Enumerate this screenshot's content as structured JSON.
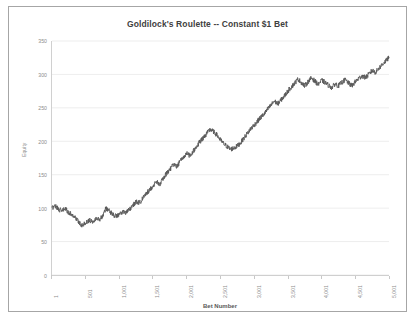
{
  "chart_data": {
    "type": "line",
    "title": "Goldilock's Roulette -- Constant $1 Bet",
    "xlabel": "Bet Number",
    "ylabel": "Equity",
    "grid": "horizontal",
    "legend": "none",
    "line_color": "#595959",
    "gridline_color": "#e8e8e8",
    "axis_color": "#bfbfbf",
    "tick_label_color": "#8c8c8c",
    "title_color": "#404040",
    "xlim": [
      1,
      5001
    ],
    "ylim": [
      0,
      350
    ],
    "yticks": [
      0,
      50,
      100,
      150,
      200,
      250,
      300,
      350
    ],
    "ytick_labels": [
      "0",
      "50",
      "100",
      "150",
      "200",
      "250",
      "300",
      "350"
    ],
    "xticks": [
      1,
      501,
      1001,
      1501,
      2001,
      2501,
      3001,
      3501,
      4001,
      4501,
      5001
    ],
    "xtick_labels": [
      "1",
      "501",
      "1,001",
      "1,501",
      "2,001",
      "2,501",
      "3,001",
      "3,501",
      "4,001",
      "4,501",
      "5,001"
    ],
    "series": [
      {
        "name": "Equity",
        "x": [
          1,
          51,
          101,
          151,
          201,
          251,
          301,
          351,
          401,
          451,
          501,
          551,
          601,
          651,
          701,
          751,
          801,
          851,
          901,
          951,
          1001,
          1051,
          1101,
          1151,
          1201,
          1251,
          1301,
          1351,
          1401,
          1451,
          1501,
          1551,
          1601,
          1651,
          1701,
          1751,
          1801,
          1851,
          1901,
          1951,
          2001,
          2051,
          2101,
          2151,
          2201,
          2251,
          2301,
          2351,
          2401,
          2451,
          2501,
          2551,
          2601,
          2651,
          2701,
          2751,
          2801,
          2851,
          2901,
          2951,
          3001,
          3051,
          3101,
          3151,
          3201,
          3251,
          3301,
          3351,
          3401,
          3451,
          3501,
          3551,
          3601,
          3651,
          3701,
          3751,
          3801,
          3851,
          3901,
          3951,
          4001,
          4051,
          4101,
          4151,
          4201,
          4251,
          4301,
          4351,
          4401,
          4451,
          4501,
          4551,
          4601,
          4651,
          4701,
          4751,
          4801,
          4851,
          4901,
          4951,
          5001
        ],
        "y": [
          100,
          104,
          98,
          96,
          99,
          93,
          90,
          86,
          79,
          74,
          78,
          82,
          80,
          85,
          83,
          88,
          100,
          96,
          91,
          88,
          90,
          95,
          93,
          98,
          104,
          110,
          108,
          115,
          122,
          128,
          133,
          139,
          136,
          144,
          152,
          158,
          165,
          162,
          170,
          176,
          182,
          178,
          186,
          193,
          200,
          206,
          212,
          218,
          214,
          209,
          202,
          196,
          192,
          188,
          190,
          193,
          198,
          205,
          212,
          219,
          224,
          230,
          236,
          241,
          248,
          254,
          260,
          256,
          262,
          268,
          275,
          281,
          287,
          293,
          288,
          283,
          289,
          295,
          290,
          285,
          291,
          288,
          284,
          280,
          286,
          283,
          288,
          292,
          287,
          283,
          289,
          294,
          298,
          295,
          300,
          306,
          303,
          309,
          315,
          320,
          325
        ],
        "final_value": 325,
        "starting_value": 100,
        "min_value": 74,
        "max_value": 325
      }
    ]
  }
}
